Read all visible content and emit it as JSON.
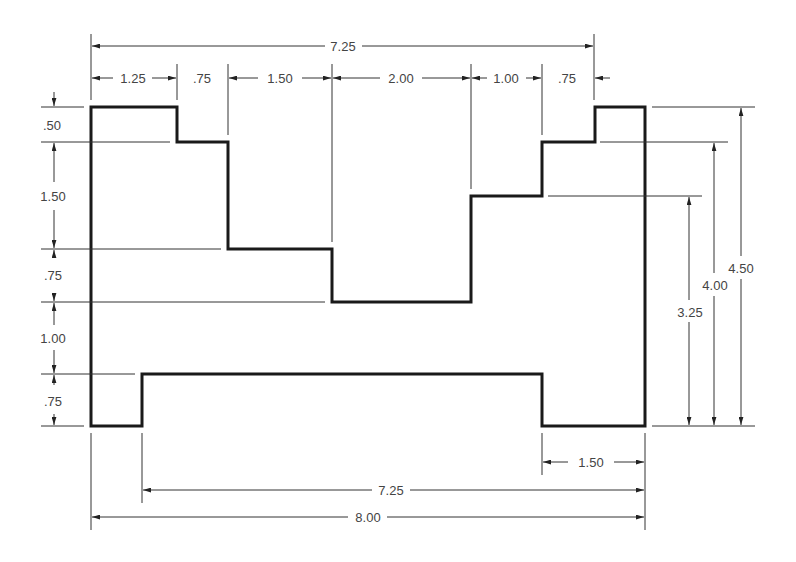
{
  "drawing": {
    "type": "dimensioned-part-outline",
    "units": "inches",
    "outline_points": [
      [
        91,
        107
      ],
      [
        177,
        107
      ],
      [
        177,
        142
      ],
      [
        228,
        142
      ],
      [
        228,
        249
      ],
      [
        332,
        249
      ],
      [
        332,
        302
      ],
      [
        471,
        302
      ],
      [
        471,
        196
      ],
      [
        542,
        196
      ],
      [
        542,
        142
      ],
      [
        595,
        142
      ],
      [
        595,
        107
      ],
      [
        645,
        107
      ],
      [
        645,
        426
      ],
      [
        542,
        426
      ],
      [
        542,
        374
      ],
      [
        142,
        374
      ],
      [
        142,
        426
      ],
      [
        91,
        426
      ]
    ]
  },
  "dimensions": {
    "top_overall": {
      "label": "7.25"
    },
    "top_chain": [
      {
        "label": "1.25"
      },
      {
        "label": ".75"
      },
      {
        "label": "1.50"
      },
      {
        "label": "2.00"
      },
      {
        "label": "1.00"
      },
      {
        "label": ".75"
      }
    ],
    "left_chain": [
      {
        "label": ".50"
      },
      {
        "label": "1.50"
      },
      {
        "label": ".75"
      },
      {
        "label": "1.00"
      },
      {
        "label": ".75"
      }
    ],
    "right": [
      {
        "label": "3.25"
      },
      {
        "label": "4.00"
      },
      {
        "label": "4.50"
      }
    ],
    "bottom": [
      {
        "label": "1.50"
      },
      {
        "label": "7.25"
      },
      {
        "label": "8.00"
      }
    ]
  }
}
